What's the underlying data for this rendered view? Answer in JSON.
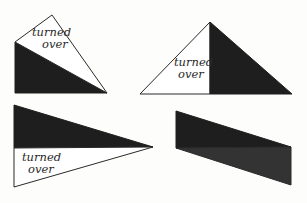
{
  "colors": {
    "dark": "#1e1e1e",
    "dark_alt": "#333333",
    "light": "#ffffff",
    "stroke": "#2a2a2a",
    "background": "#fdfdfb"
  },
  "figures": [
    {
      "id": "top-left",
      "label_line1": "turned",
      "label_line2": "over"
    },
    {
      "id": "top-right",
      "label_line1": "turned",
      "label_line2": "over"
    },
    {
      "id": "bottom-left",
      "label_line1": "turned",
      "label_line2": "over"
    },
    {
      "id": "bottom-right"
    }
  ]
}
